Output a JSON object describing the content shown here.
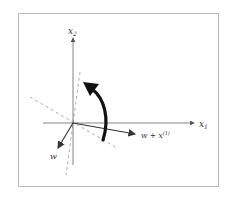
{
  "diagram": {
    "title": "",
    "frame": {
      "x": 18,
      "y": 13,
      "width": 200,
      "height": 173,
      "stroke": "#bbbbbb"
    },
    "origin": {
      "x": 73,
      "y": 123
    },
    "axes": {
      "x1": {
        "label": "x",
        "subscript": "1",
        "from": [
          43,
          123
        ],
        "to": [
          194,
          123
        ]
      },
      "x2": {
        "label": "x",
        "subscript": "2",
        "from": [
          73,
          165
        ],
        "to": [
          73,
          38
        ]
      }
    },
    "vectors": [
      {
        "name": "w",
        "label": "w",
        "superscript": "",
        "to": [
          58,
          148
        ]
      },
      {
        "name": "w-plus-x1",
        "label": "w + x",
        "superscript": "(1)",
        "to": [
          135,
          134
        ]
      }
    ],
    "dashed_lines": [
      {
        "name": "old-boundary",
        "from": [
          30,
          97
        ],
        "to": [
          117,
          148
        ]
      },
      {
        "name": "new-boundary",
        "from": [
          80,
          72
        ],
        "to": [
          66,
          175
        ]
      }
    ],
    "rotation_arrow": {
      "meaning": "rotation of decision boundary",
      "from": [
        103,
        140
      ],
      "to": [
        84,
        83
      ]
    },
    "colors": {
      "axis": "#666666",
      "vector": "#333333",
      "dashed": "#999999",
      "rotation": "#111111",
      "text": "#333333"
    }
  }
}
